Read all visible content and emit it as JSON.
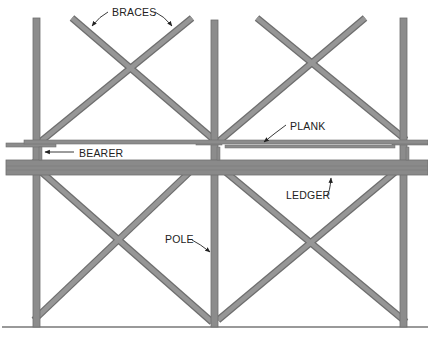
{
  "diagram": {
    "colors": {
      "member_fill": "#8c8c8c",
      "member_edge": "#6e6e6e",
      "ledger_fill": "#8a8a8a",
      "ground": "#777777",
      "label": "#222222",
      "background": "#ffffff"
    },
    "labels": {
      "braces": "BRACES",
      "bearer": "BEARER",
      "plank": "PLANK",
      "ledger": "LEDGER",
      "pole": "POLE"
    },
    "components": [
      {
        "name": "pole",
        "count": 3,
        "orientation": "vertical"
      },
      {
        "name": "brace",
        "count": 8,
        "orientation": "diagonal"
      },
      {
        "name": "plank",
        "count": 1,
        "orientation": "horizontal"
      },
      {
        "name": "bearer",
        "count": 3,
        "orientation": "horizontal"
      },
      {
        "name": "ledger",
        "count": 1,
        "orientation": "horizontal"
      }
    ]
  }
}
